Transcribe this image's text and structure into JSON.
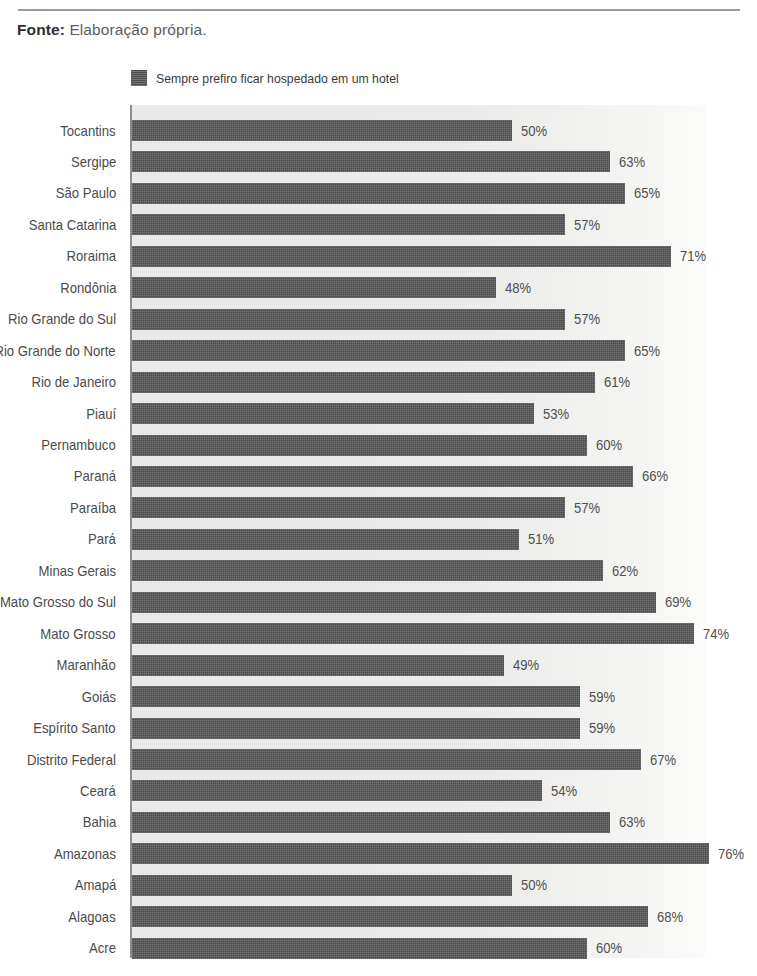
{
  "source_note": {
    "label": "Fonte:",
    "value": "Elaboração própria."
  },
  "legend": {
    "swatch_color": "#4a4a4a",
    "label": "Sempre prefiro ficar hospedado em um hotel"
  },
  "chart_data": {
    "type": "bar",
    "orientation": "horizontal",
    "title": "",
    "subtitle": "",
    "xlabel": "",
    "ylabel": "",
    "xlim": [
      0,
      80
    ],
    "grid": false,
    "legend_position": "top-left",
    "value_suffix": "%",
    "series": [
      {
        "name": "Sempre prefiro ficar hospedado em um hotel",
        "color": "#4a4a4a",
        "values": [
          50,
          63,
          65,
          57,
          71,
          48,
          57,
          65,
          61,
          53,
          60,
          66,
          57,
          51,
          62,
          69,
          74,
          49,
          59,
          59,
          67,
          54,
          63,
          76,
          50,
          68,
          60
        ]
      }
    ],
    "categories": [
      "Tocantins",
      "Sergipe",
      "São Paulo",
      "Santa Catarina",
      "Roraima",
      "Rondônia",
      "Rio Grande do Sul",
      "Rio Grande do Norte",
      "Rio de Janeiro",
      "Piauí",
      "Pernambuco",
      "Paraná",
      "Paraíba",
      "Pará",
      "Minas Gerais",
      "Mato Grosso do Sul",
      "Mato Grosso",
      "Maranhão",
      "Goiás",
      "Espírito Santo",
      "Distrito Federal",
      "Ceará",
      "Bahia",
      "Amazonas",
      "Amapá",
      "Alagoas",
      "Acre"
    ],
    "data_labels": [
      "50%",
      "63%",
      "65%",
      "57%",
      "71%",
      "48%",
      "57%",
      "65%",
      "61%",
      "53%",
      "60%",
      "66%",
      "57%",
      "51%",
      "62%",
      "69%",
      "74%",
      "49%",
      "59%",
      "59%",
      "67%",
      "54%",
      "63%",
      "76%",
      "50%",
      "68%",
      "60%"
    ]
  }
}
